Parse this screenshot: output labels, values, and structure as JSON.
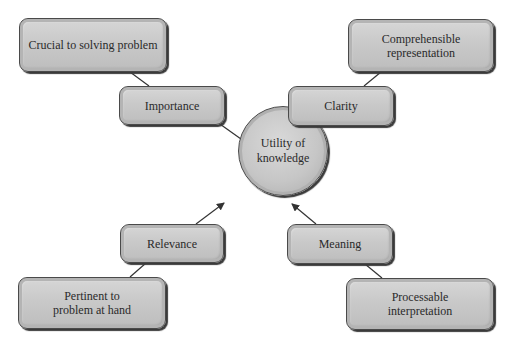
{
  "diagram": {
    "center": {
      "label_line1": "Utility of",
      "label_line2": "knowledge"
    },
    "nodes": {
      "importance": {
        "label": "Importance",
        "detail_line1": "Crucial to solving problem",
        "detail_line2": ""
      },
      "clarity": {
        "label": "Clarity",
        "detail_line1": "Comprehensible",
        "detail_line2": "representation"
      },
      "relevance": {
        "label": "Relevance",
        "detail_line1": "Pertinent to",
        "detail_line2": "problem at hand"
      },
      "meaning": {
        "label": "Meaning",
        "detail_line1": "Processable",
        "detail_line2": "interpretation"
      }
    },
    "colors": {
      "box_fill": "#c9c9c9",
      "border": "#4a4a4a",
      "connector": "#333333",
      "text": "#2a2a2a"
    }
  }
}
